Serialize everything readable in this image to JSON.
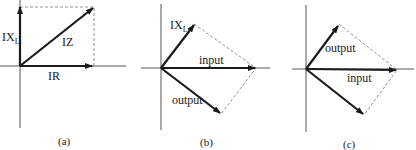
{
  "diagrams": [
    {
      "id": "a",
      "caption": "(a)",
      "labels": {
        "reactive": "IX",
        "reactive_sub": "L",
        "impedance": "IZ",
        "resistive": "IR"
      }
    },
    {
      "id": "b",
      "caption": "(b)",
      "labels": {
        "reactive": "IX",
        "reactive_sub": "L",
        "input": "input",
        "output": "output"
      }
    },
    {
      "id": "c",
      "caption": "(c)",
      "labels": {
        "output": "output",
        "input": "input"
      }
    }
  ],
  "colors": {
    "ink": "#1a1a1a",
    "axis": "#555555",
    "dashed": "#777777"
  }
}
